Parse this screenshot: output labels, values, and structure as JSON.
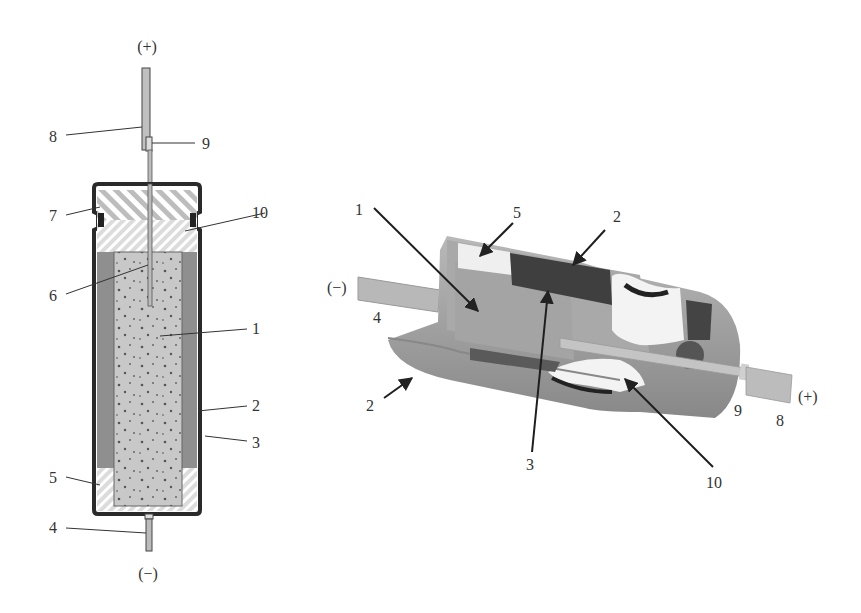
{
  "colors": {
    "background": "#ffffff",
    "outline": "#333333",
    "anode_fill": "#c8c8c8",
    "cathode_layer": "#8c8c8c",
    "hatch": "#9a9a9a",
    "photo_body": "#9e9e9e",
    "photo_dark": "#3a3a3a",
    "photo_light": "#f2f2f2",
    "lead": "#b5b5b5"
  },
  "left_diagram": {
    "polarity_top": "(+)",
    "polarity_bottom": "(−)",
    "labels": [
      {
        "num": "8",
        "part": "positive lead wire"
      },
      {
        "num": "9",
        "part": "weld joint"
      },
      {
        "num": "7",
        "part": "seal"
      },
      {
        "num": "10",
        "part": "insulating spacer"
      },
      {
        "num": "6",
        "part": "tantalum anode wire"
      },
      {
        "num": "1",
        "part": "sintered tantalum anode"
      },
      {
        "num": "2",
        "part": "case"
      },
      {
        "num": "3",
        "part": "electrolyte / cathode layer"
      },
      {
        "num": "5",
        "part": "bottom spacer"
      },
      {
        "num": "4",
        "part": "negative lead"
      }
    ]
  },
  "right_diagram": {
    "polarity_left": "(−)",
    "polarity_right": "(+)",
    "labels": [
      {
        "num": "1"
      },
      {
        "num": "5"
      },
      {
        "num": "2",
        "position": "top"
      },
      {
        "num": "4"
      },
      {
        "num": "2",
        "position": "bottom-left"
      },
      {
        "num": "3"
      },
      {
        "num": "10"
      },
      {
        "num": "9"
      },
      {
        "num": "8"
      }
    ]
  }
}
